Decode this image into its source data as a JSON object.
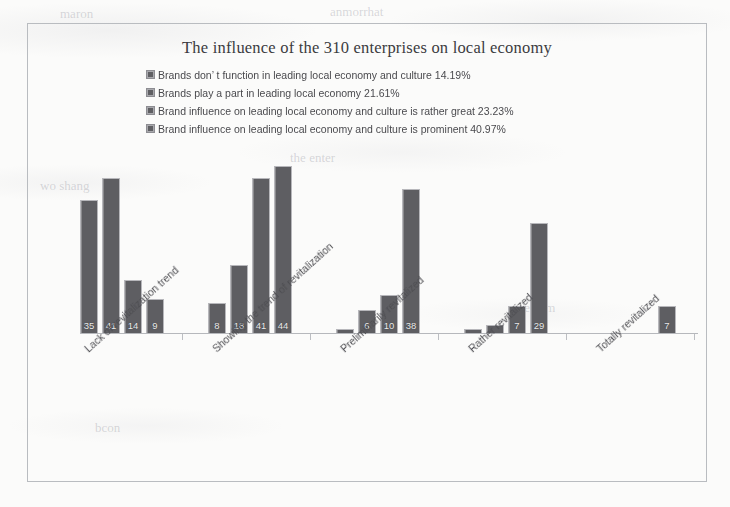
{
  "chart_data": {
    "type": "bar",
    "title": "The influence of the 310 enterprises on local economy",
    "xlabel": "",
    "ylabel": "",
    "grid": false,
    "legend_position": "top-left",
    "ylim": [
      0,
      48
    ],
    "categories": [
      "Lack of revitalization trend",
      "Showing the trend of revitalization",
      "Preliminarily revitalized",
      "Rather revitalized",
      "Totally revitalized"
    ],
    "series": [
      {
        "name": "Brands don’ t function in leading local economy and culture",
        "percent": "14.19%",
        "legend_label": "Brands don’ t function in leading local economy and culture  14.19%",
        "color": "#5e5e62",
        "values": [
          35,
          8,
          1,
          1,
          0
        ],
        "labels": [
          "35",
          "8",
          "",
          "",
          ""
        ]
      },
      {
        "name": "Brands play a part in leading local economy",
        "percent": "21.61%",
        "legend_label": "Brands play a part in leading local economy  21.61%",
        "color": "#5e5e62",
        "values": [
          41,
          18,
          6,
          2,
          0
        ],
        "labels": [
          "41",
          "18",
          "6",
          "",
          ""
        ]
      },
      {
        "name": "Brand influence on leading local economy and culture is rather great",
        "percent": "23.23%",
        "legend_label": "Brand influence on leading local economy and culture is rather great  23.23%",
        "color": "#5e5e62",
        "values": [
          14,
          41,
          10,
          7,
          0
        ],
        "labels": [
          "14",
          "41",
          "10",
          "7",
          ""
        ]
      },
      {
        "name": "Brand influence on leading local economy and culture is prominent",
        "percent": "40.97%",
        "legend_label": "Brand influence on leading local economy and culture is prominent 40.97%",
        "color": "#5e5e62",
        "values": [
          9,
          44,
          38,
          29,
          7
        ],
        "labels": [
          "9",
          "44",
          "38",
          "29",
          "7"
        ]
      }
    ]
  },
  "bleed_text": {
    "t1": "maron",
    "t2": "anmorrhat",
    "t3": "wo shang",
    "t4": "the enter",
    "t5": "bcon",
    "t6": "reform",
    "t7": "in local",
    "t8": "ences"
  }
}
